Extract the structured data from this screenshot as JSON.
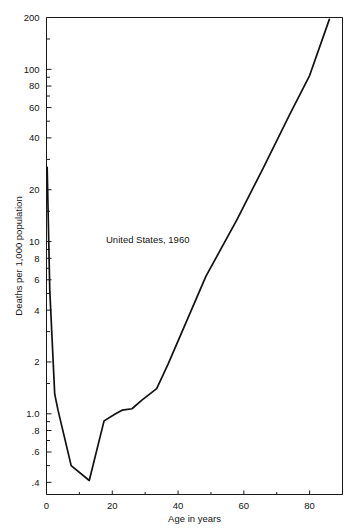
{
  "chart_data": {
    "type": "line",
    "title": "",
    "annotation": "United States, 1960",
    "xlabel": "Age in years",
    "ylabel": "Deaths per 1,000 population",
    "xlim": [
      0,
      90
    ],
    "ylim": [
      0.34,
      200
    ],
    "yscale": "log",
    "xscale": "linear",
    "grid": false,
    "legend": "none",
    "x_ticks": [
      {
        "value": 0,
        "label": "0"
      },
      {
        "value": 20,
        "label": "20"
      },
      {
        "value": 40,
        "label": "40"
      },
      {
        "value": 60,
        "label": "60"
      },
      {
        "value": 80,
        "label": "80"
      }
    ],
    "x_minor_ticks": [
      10,
      30,
      50,
      70,
      90
    ],
    "y_ticks": [
      {
        "value": 200,
        "label": "200"
      },
      {
        "value": 100,
        "label": "100"
      },
      {
        "value": 80,
        "label": "80"
      },
      {
        "value": 60,
        "label": "60"
      },
      {
        "value": 40,
        "label": "40"
      },
      {
        "value": 20,
        "label": "20"
      },
      {
        "value": 10,
        "label": "10"
      },
      {
        "value": 8,
        "label": "8"
      },
      {
        "value": 6,
        "label": "6"
      },
      {
        "value": 4,
        "label": "4"
      },
      {
        "value": 2,
        "label": "2"
      },
      {
        "value": 1.0,
        "label": "1.0"
      },
      {
        "value": 0.8,
        "label": ".8"
      },
      {
        "value": 0.6,
        "label": ".6"
      },
      {
        "value": 0.4,
        "label": ".4"
      }
    ],
    "y_minor_ticks": [
      150,
      90,
      70,
      50,
      30,
      15,
      9,
      7,
      5,
      3,
      1.5,
      0.9,
      0.7,
      0.5
    ],
    "series": [
      {
        "name": "Deaths per 1,000 population",
        "x": [
          0.2,
          1.0,
          2.5,
          3.5,
          7.5,
          13.0,
          17.5,
          21.0,
          23.0,
          26.0,
          29.0,
          33.5,
          37.0,
          48.5,
          58.0,
          66.0,
          74.0,
          80.0,
          86.0
        ],
        "y": [
          27.0,
          5.2,
          1.3,
          1.05,
          0.5,
          0.41,
          0.91,
          1.0,
          1.05,
          1.07,
          1.2,
          1.4,
          1.95,
          6.3,
          13.5,
          27.0,
          55.0,
          92.0,
          195.0
        ]
      }
    ]
  },
  "colors": {
    "line": "#111111",
    "axis": "#1a1a1a",
    "background": "#ffffff",
    "text": "#141414"
  }
}
